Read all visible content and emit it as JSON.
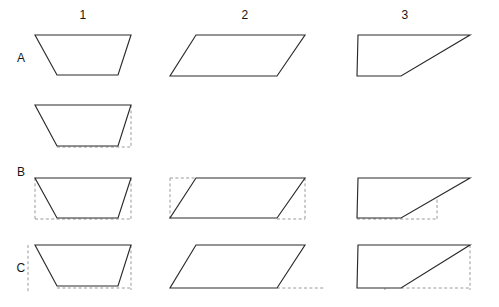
{
  "figure": {
    "width": 499,
    "height": 307,
    "background_color": "#ffffff",
    "solid_line_color": "#2b2b2b",
    "dashed_line_color": "#9a9a9a"
  },
  "columns": [
    {
      "id": "col-1",
      "label": "1",
      "center_x": 83
    },
    {
      "id": "col-2",
      "label": "2",
      "center_x": 245
    },
    {
      "id": "col-3",
      "label": "3",
      "center_x": 405
    }
  ],
  "rows": [
    {
      "id": "row-a",
      "label": "A",
      "label_y": 58
    },
    {
      "id": "row-unlabeled",
      "label": "",
      "label_y": 125
    },
    {
      "id": "row-b",
      "label": "B",
      "label_y": 172
    },
    {
      "id": "row-c",
      "label": "C",
      "label_y": 268
    }
  ],
  "row_labels": {
    "a": "A",
    "b": "B",
    "c": "C"
  },
  "shapes": {
    "a1": {
      "name": "isosceles-trapezoid",
      "solid_points": "35,35 131,35 118,75 57,75",
      "dashed_segments": []
    },
    "a2": {
      "name": "parallelogram",
      "solid_points": "196,35 305,35 277,76 170,76",
      "dashed_segments": []
    },
    "a3": {
      "name": "right-trapezoid",
      "solid_points": "358,35 470,35 401,76 357,76",
      "dashed_segments": []
    },
    "mid1": {
      "name": "trapezoid-with-height-and-base-guides",
      "solid_points": "35,105 131,105 118,146 57,146",
      "dashed_segments": [
        "57,105 57,147",
        "131,105 131,147",
        "57,147 131,147"
      ]
    },
    "b1": {
      "name": "trapezoid-with-bounding-guides",
      "solid_points": "35,178 131,178 118,218 57,218",
      "dashed_segments": [
        "35,178 35,219",
        "131,178 131,219",
        "35,219 131,219"
      ]
    },
    "b2": {
      "name": "parallelogram-with-bounding-rectangle",
      "solid_points": "196,178 305,178 277,218 170,218",
      "dashed_segments": [
        "170,178 170,219",
        "305,178 305,219",
        "170,178 196,178",
        "277,219 305,219"
      ]
    },
    "b3": {
      "name": "right-trapezoid-with-bounding-guides",
      "solid_points": "358,178 470,178 401,218 357,218",
      "dashed_segments": [
        "374,178 374,219",
        "437,178 437,219",
        "357,219 437,219"
      ]
    },
    "c1": {
      "name": "trapezoid-with-outer-bounding-guides",
      "solid_points": "35,245 131,245 118,286 57,286",
      "dashed_segments": [
        "28,245 28,292",
        "131,245 131,290",
        "57,288 131,288"
      ]
    },
    "c2": {
      "name": "parallelogram-with-height-guide",
      "solid_points": "196,245 305,245 277,288 170,288",
      "dashed_segments": [
        "196,245 196,288",
        "277,288 325,288"
      ]
    },
    "c3": {
      "name": "right-trapezoid-with-height-and-base-guides",
      "solid_points": "358,245 470,245 401,288 357,288",
      "dashed_segments": [
        "385,245 385,290",
        "470,245 470,290",
        "401,288 470,288"
      ]
    }
  },
  "chart_data": {
    "type": "diagram",
    "grid_rows": [
      "A",
      "",
      "B",
      "C"
    ],
    "grid_columns": [
      "1",
      "2",
      "3"
    ],
    "cells": [
      {
        "row": "A",
        "column": "1",
        "shape": "isosceles trapezoid",
        "guides": "none"
      },
      {
        "row": "A",
        "column": "2",
        "shape": "parallelogram",
        "guides": "none"
      },
      {
        "row": "A",
        "column": "3",
        "shape": "right trapezoid",
        "guides": "none"
      },
      {
        "row": "",
        "column": "1",
        "shape": "isosceles trapezoid",
        "guides": "two vertical dashed heights and dashed base extension"
      },
      {
        "row": "B",
        "column": "1",
        "shape": "isosceles trapezoid",
        "guides": "dashed bounding rectangle sides and base"
      },
      {
        "row": "B",
        "column": "2",
        "shape": "parallelogram",
        "guides": "dashed bounding rectangle"
      },
      {
        "row": "B",
        "column": "3",
        "shape": "right trapezoid",
        "guides": "dashed interior rectangle"
      },
      {
        "row": "C",
        "column": "1",
        "shape": "isosceles trapezoid",
        "guides": "dashed outer vertical guides and base"
      },
      {
        "row": "C",
        "column": "2",
        "shape": "parallelogram",
        "guides": "dashed vertical height and base extension"
      },
      {
        "row": "C",
        "column": "3",
        "shape": "right trapezoid",
        "guides": "dashed vertical height and base extension"
      }
    ]
  }
}
